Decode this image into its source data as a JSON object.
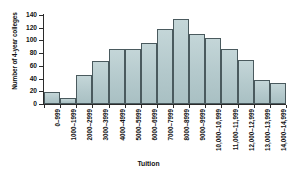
{
  "chart_data": {
    "type": "bar",
    "title": "",
    "xlabel": "Tuition",
    "ylabel": "Number of 4-year colleges",
    "categories": [
      "0–999",
      "1000–1999",
      "2000–2999",
      "3000–3999",
      "4000–4999",
      "5000–5999",
      "6000–6999",
      "7000–7999",
      "8000–8999",
      "9000–9999",
      "10,000–10,999",
      "11,000–11,999",
      "12,000–12,999",
      "13,000–13,999",
      "14,000–14,999"
    ],
    "values": [
      19,
      10,
      46,
      67,
      86,
      86,
      96,
      118,
      133,
      110,
      104,
      86,
      69,
      38,
      33
    ],
    "ylim": [
      0,
      140
    ],
    "yticks": [
      0,
      20,
      40,
      60,
      80,
      100,
      120,
      140
    ],
    "ytick_labels": [
      "0",
      "20",
      "40",
      "60",
      "80",
      "100",
      "120",
      "140"
    ],
    "grid": false,
    "legend": "none",
    "bar_fill_color": "#b8cdd0",
    "bar_edge_color": "#4a5a5e",
    "axis_color": "#2b2b2b",
    "background_color": "#ffffff"
  }
}
